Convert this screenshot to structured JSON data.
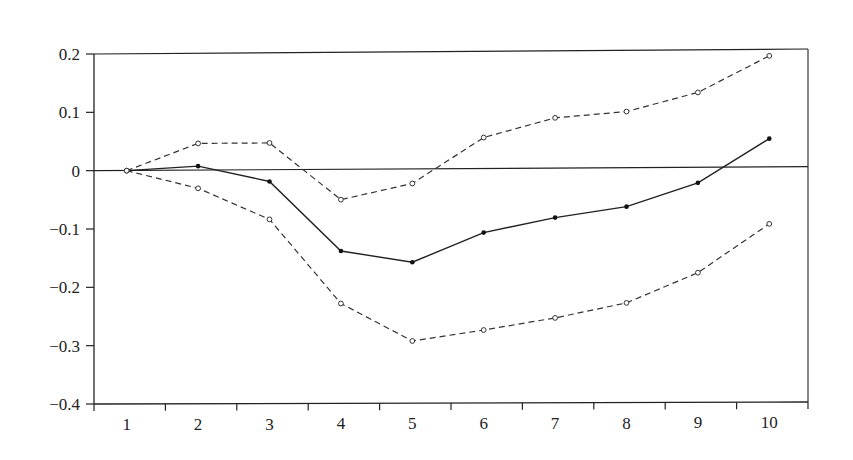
{
  "chart_data": {
    "type": "line",
    "title": "",
    "xlabel": "",
    "ylabel": "",
    "x": [
      1,
      2,
      3,
      4,
      5,
      6,
      7,
      8,
      9,
      10
    ],
    "categories": [
      "1",
      "2",
      "3",
      "4",
      "5",
      "6",
      "7",
      "8",
      "9",
      "10"
    ],
    "ylim": [
      -0.4,
      0.2
    ],
    "yticks": [
      0.2,
      0.1,
      0,
      -0.1,
      -0.2,
      -0.3,
      -0.4
    ],
    "ytick_labels": [
      "0.2",
      "0.1",
      "0",
      "−0.1",
      "−0.2",
      "−0.3",
      "−0.4"
    ],
    "grid": false,
    "legend": null,
    "zero_line": true,
    "series": [
      {
        "name": "upper band",
        "style": "dashed",
        "marker": "open-circle",
        "color": "#333333",
        "values": [
          0.0,
          0.046,
          0.046,
          -0.052,
          -0.025,
          0.053,
          0.086,
          0.096,
          0.128,
          0.19
        ]
      },
      {
        "name": "response",
        "style": "solid",
        "marker": "filled-dot",
        "color": "#222222",
        "values": [
          0.0,
          0.007,
          -0.02,
          -0.14,
          -0.16,
          -0.11,
          -0.085,
          -0.067,
          -0.027,
          0.048
        ]
      },
      {
        "name": "lower band",
        "style": "dashed",
        "marker": "open-circle",
        "color": "#333333",
        "values": [
          0.0,
          -0.031,
          -0.085,
          -0.23,
          -0.295,
          -0.277,
          -0.257,
          -0.232,
          -0.181,
          -0.098
        ]
      }
    ]
  }
}
